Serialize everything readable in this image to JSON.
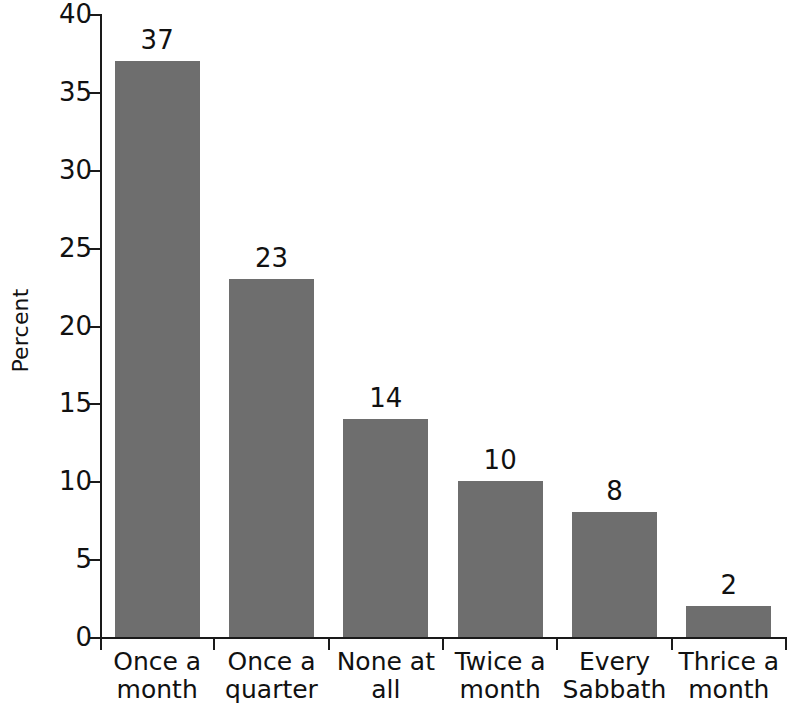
{
  "chart_data": {
    "type": "bar",
    "title": "",
    "subtitle": "",
    "xlabel": "",
    "ylabel": "Percent",
    "categories": [
      "Once a month",
      "Once a quarter",
      "None at all",
      "Twice a month",
      "Every Sabbath",
      "Thrice a month"
    ],
    "category_lines": [
      [
        "Once a",
        "month"
      ],
      [
        "Once a",
        "quarter"
      ],
      [
        "None at",
        "all"
      ],
      [
        "Twice a",
        "month"
      ],
      [
        "Every",
        "Sabbath"
      ],
      [
        "Thrice a",
        "month"
      ]
    ],
    "values": [
      37,
      23,
      14,
      10,
      8,
      2
    ],
    "value_labels": [
      "37",
      "23",
      "14",
      "10",
      "8",
      "2"
    ],
    "ylim": [
      0,
      40
    ],
    "yticks": [
      0,
      5,
      10,
      15,
      20,
      25,
      30,
      35,
      40
    ],
    "ytick_labels": [
      "0",
      "5",
      "10",
      "15",
      "20",
      "25",
      "30",
      "35",
      "40"
    ],
    "grid": false,
    "legend": null,
    "bar_color": "#6e6e6e",
    "axis_color": "#1a1a1a",
    "background": "#ffffff"
  }
}
